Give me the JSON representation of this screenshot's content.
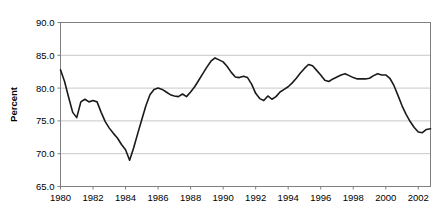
{
  "chart_data": {
    "type": "line",
    "title": "",
    "subtitle": "",
    "xlabel": "",
    "ylabel": "Percent",
    "xlim": [
      1980.0,
      2002.75
    ],
    "ylim": [
      65.0,
      90.0
    ],
    "grid": true,
    "grid_axis": "y",
    "legend": false,
    "legend_position": "none",
    "x_tick_labels": [
      "1980",
      "1982",
      "1984",
      "1986",
      "1988",
      "1990",
      "1992",
      "1994",
      "1996",
      "1998",
      "2000",
      "2002"
    ],
    "x_tick_values": [
      1980,
      1982,
      1984,
      1986,
      1988,
      1990,
      1992,
      1994,
      1996,
      1998,
      2000,
      2002
    ],
    "y_tick_labels": [
      "65.0",
      "70.0",
      "75.0",
      "80.0",
      "85.0",
      "90.0"
    ],
    "y_tick_values": [
      65.0,
      70.0,
      75.0,
      80.0,
      85.0,
      90.0
    ],
    "line_color": "#1a1a1a",
    "line_width": 1.6,
    "plot_border_color": "#808080",
    "grid_color": "#c8c8c8",
    "background_color": "#ffffff",
    "series": [
      {
        "name": "Percent",
        "x": [
          1980.0,
          1980.25,
          1980.5,
          1980.75,
          1981.0,
          1981.25,
          1981.5,
          1981.75,
          1982.0,
          1982.25,
          1982.5,
          1982.75,
          1983.0,
          1983.25,
          1983.5,
          1983.75,
          1984.0,
          1984.25,
          1984.5,
          1984.75,
          1985.0,
          1985.25,
          1985.5,
          1985.75,
          1986.0,
          1986.25,
          1986.5,
          1986.75,
          1987.0,
          1987.25,
          1987.5,
          1987.75,
          1988.0,
          1988.25,
          1988.5,
          1988.75,
          1989.0,
          1989.25,
          1989.5,
          1989.75,
          1990.0,
          1990.25,
          1990.5,
          1990.75,
          1991.0,
          1991.25,
          1991.5,
          1991.75,
          1992.0,
          1992.25,
          1992.5,
          1992.75,
          1993.0,
          1993.25,
          1993.5,
          1993.75,
          1994.0,
          1994.25,
          1994.5,
          1994.75,
          1995.0,
          1995.25,
          1995.5,
          1995.75,
          1996.0,
          1996.25,
          1996.5,
          1996.75,
          1997.0,
          1997.25,
          1997.5,
          1997.75,
          1998.0,
          1998.25,
          1998.5,
          1998.75,
          1999.0,
          1999.25,
          1999.5,
          1999.75,
          2000.0,
          2000.25,
          2000.5,
          2000.75,
          2001.0,
          2001.25,
          2001.5,
          2001.75,
          2002.0,
          2002.25,
          2002.5,
          2002.75
        ],
        "values": [
          82.8,
          81.0,
          78.6,
          76.3,
          75.5,
          77.9,
          78.3,
          77.9,
          78.1,
          77.9,
          76.3,
          74.9,
          73.9,
          73.1,
          72.4,
          71.4,
          70.6,
          69.0,
          70.9,
          73.1,
          75.2,
          77.3,
          79.0,
          79.8,
          80.0,
          79.8,
          79.4,
          79.0,
          78.8,
          78.7,
          79.1,
          78.7,
          79.4,
          80.2,
          81.2,
          82.2,
          83.2,
          84.1,
          84.6,
          84.3,
          84.0,
          83.3,
          82.4,
          81.7,
          81.6,
          81.8,
          81.6,
          80.6,
          79.2,
          78.4,
          78.1,
          78.8,
          78.3,
          78.7,
          79.4,
          79.8,
          80.2,
          80.8,
          81.5,
          82.3,
          83.0,
          83.6,
          83.4,
          82.7,
          82.0,
          81.2,
          81.0,
          81.4,
          81.7,
          82.0,
          82.2,
          81.9,
          81.6,
          81.4,
          81.4,
          81.4,
          81.5,
          81.9,
          82.2,
          82.0,
          82.0,
          81.5,
          80.4,
          78.9,
          77.3,
          76.0,
          74.9,
          74.0,
          73.3,
          73.2,
          73.7,
          73.8
        ]
      }
    ]
  },
  "axis": {
    "y_title": "Percent"
  }
}
